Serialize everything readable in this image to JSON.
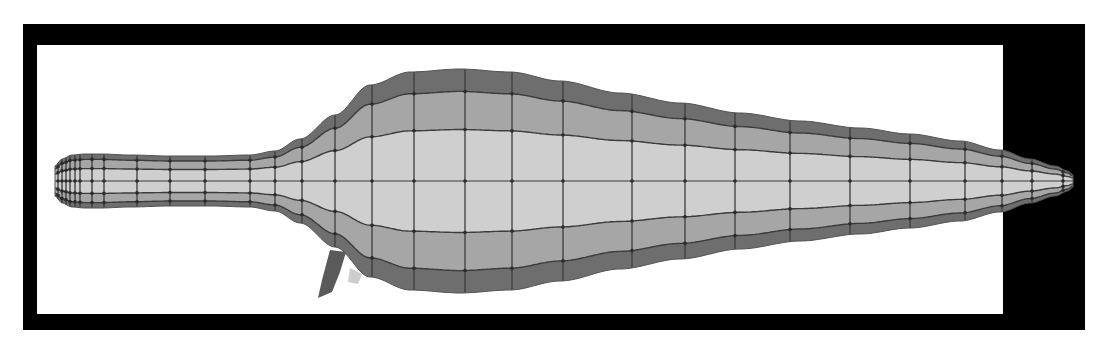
{
  "figure": {
    "colors": {
      "frame": "#000000",
      "background": "#ffffff",
      "outer_band": "#6e6e6e",
      "middle_band": "#a6a6a6",
      "inner_band": "#cfcfcf",
      "mesh_line": "#3c3c3c",
      "appendage": "#5a5a5a"
    },
    "frame": {
      "outer": {
        "x": 23,
        "y": 24,
        "w": 1062,
        "h": 306
      },
      "inner_white": {
        "x": 37,
        "y": 45,
        "w": 966,
        "h": 269
      }
    },
    "centerline_y": 181,
    "profile": {
      "x": [
        55,
        62,
        72,
        85,
        100,
        130,
        170,
        210,
        250,
        275,
        300,
        335,
        370,
        410,
        460,
        510,
        560,
        620,
        680,
        740,
        800,
        860,
        910,
        960,
        1000,
        1030,
        1055,
        1068,
        1073
      ],
      "half": [
        15,
        22,
        26,
        27,
        27,
        26,
        25,
        25,
        26,
        30,
        42,
        66,
        96,
        109,
        112,
        109,
        100,
        88,
        78,
        68,
        60,
        53,
        47,
        40,
        31,
        22,
        15,
        10,
        6
      ]
    },
    "cross_sections_x": [
      58,
      62,
      66,
      70,
      75,
      80,
      92,
      104,
      137,
      170,
      205,
      250,
      275,
      302,
      335,
      372,
      414,
      465,
      512,
      563,
      632,
      685,
      735,
      790,
      850,
      910,
      965,
      1002,
      1032,
      1063
    ]
  }
}
